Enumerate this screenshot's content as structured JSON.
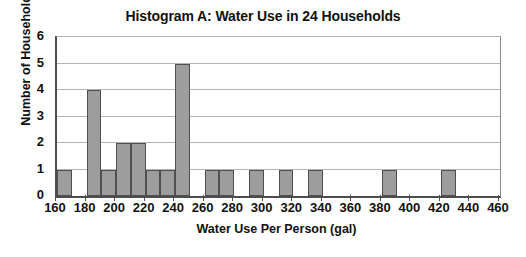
{
  "chart_data": {
    "type": "bar",
    "title": "Histogram A: Water Use in 24 Households",
    "xlabel": "Water Use Per Person (gal)",
    "ylabel": "Number of Households",
    "xlim": [
      160,
      460
    ],
    "ylim": [
      0,
      6
    ],
    "xtick_step": 20,
    "ytick_step": 1,
    "bin_width": 10,
    "grid": true,
    "legend": null,
    "bar_color": "#9d9d9d",
    "bar_edge_color": "#4f4f4f",
    "axis_color": "#4d4d4d",
    "gridline_color": "#b5b5b5",
    "total_count": 24,
    "xticks": [
      160,
      180,
      200,
      220,
      240,
      260,
      280,
      300,
      320,
      340,
      360,
      380,
      400,
      420,
      440,
      460
    ],
    "yticks": [
      0,
      1,
      2,
      3,
      4,
      5,
      6
    ],
    "bins": [
      {
        "start": 160,
        "end": 170,
        "count": 1
      },
      {
        "start": 170,
        "end": 180,
        "count": 0
      },
      {
        "start": 180,
        "end": 190,
        "count": 4
      },
      {
        "start": 190,
        "end": 200,
        "count": 1
      },
      {
        "start": 200,
        "end": 210,
        "count": 2
      },
      {
        "start": 210,
        "end": 220,
        "count": 2
      },
      {
        "start": 220,
        "end": 230,
        "count": 1
      },
      {
        "start": 230,
        "end": 240,
        "count": 1
      },
      {
        "start": 240,
        "end": 250,
        "count": 5
      },
      {
        "start": 250,
        "end": 260,
        "count": 0
      },
      {
        "start": 260,
        "end": 270,
        "count": 1
      },
      {
        "start": 270,
        "end": 280,
        "count": 1
      },
      {
        "start": 280,
        "end": 290,
        "count": 0
      },
      {
        "start": 290,
        "end": 300,
        "count": 1
      },
      {
        "start": 300,
        "end": 310,
        "count": 0
      },
      {
        "start": 310,
        "end": 320,
        "count": 1
      },
      {
        "start": 320,
        "end": 330,
        "count": 0
      },
      {
        "start": 330,
        "end": 340,
        "count": 1
      },
      {
        "start": 340,
        "end": 350,
        "count": 0
      },
      {
        "start": 350,
        "end": 360,
        "count": 0
      },
      {
        "start": 360,
        "end": 370,
        "count": 0
      },
      {
        "start": 370,
        "end": 380,
        "count": 0
      },
      {
        "start": 380,
        "end": 390,
        "count": 1
      },
      {
        "start": 390,
        "end": 400,
        "count": 0
      },
      {
        "start": 400,
        "end": 410,
        "count": 0
      },
      {
        "start": 410,
        "end": 420,
        "count": 0
      },
      {
        "start": 420,
        "end": 430,
        "count": 1
      },
      {
        "start": 430,
        "end": 440,
        "count": 0
      },
      {
        "start": 440,
        "end": 450,
        "count": 0
      },
      {
        "start": 450,
        "end": 460,
        "count": 0
      }
    ]
  }
}
